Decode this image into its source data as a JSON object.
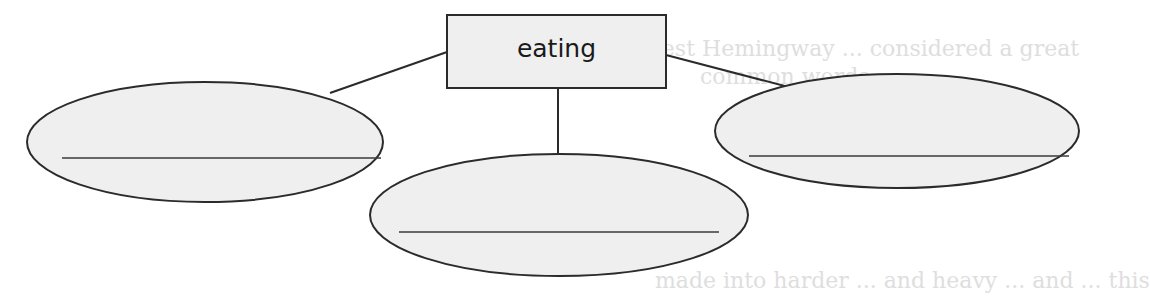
{
  "diagram": {
    "type": "concept-web",
    "center": {
      "label": "eating"
    },
    "branches": [
      {
        "position": "left",
        "answer": ""
      },
      {
        "position": "bottom",
        "answer": ""
      },
      {
        "position": "right",
        "answer": ""
      }
    ]
  },
  "background_bleed": {
    "line1": "d Ernest Hemingway ... considered a great",
    "line2": "common words",
    "line3": "made into harder ... and heavy ... and ... this"
  },
  "colors": {
    "stroke": "#2b2b2b",
    "fill": "#efefef",
    "background": "#ffffff"
  }
}
